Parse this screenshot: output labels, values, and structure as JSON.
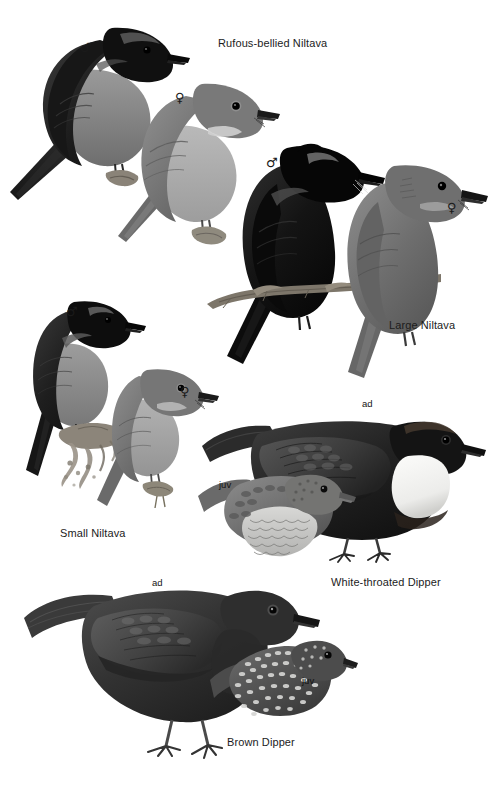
{
  "page": {
    "width": 499,
    "height": 788,
    "background": "#ffffff",
    "type": "field-guide-illustration-plate"
  },
  "palette": {
    "ink": "#1c1c1c",
    "dark_plumage": "#242424",
    "black_plumage": "#0d0d0d",
    "mid_grey": "#6f6f6f",
    "light_grey": "#a9a9a9",
    "pale_belly": "#c8c8c8",
    "white_patch": "#f2f2ef",
    "perch_brown": "#7a7369"
  },
  "plates": [
    {
      "id": "rufous-bellied-niltava",
      "label": "Rufous-bellied Niltava",
      "label_pos": {
        "x": 218,
        "y": 38
      },
      "birds": [
        {
          "id": "rbn-male",
          "sex": "♂",
          "sex_pos": {
            "x": 80,
            "y": 41
          }
        },
        {
          "id": "rbn-female",
          "sex": "♀",
          "sex_pos": {
            "x": 175,
            "y": 91
          }
        }
      ]
    },
    {
      "id": "large-niltava",
      "label": "Large Niltava",
      "label_pos": {
        "x": 389,
        "y": 320
      },
      "birds": [
        {
          "id": "ln-male",
          "sex": "♂",
          "sex_pos": {
            "x": 266,
            "y": 156
          }
        },
        {
          "id": "ln-female",
          "sex": "♀",
          "sex_pos": {
            "x": 447,
            "y": 201
          }
        }
      ]
    },
    {
      "id": "small-niltava",
      "label": "Small Niltava",
      "label_pos": {
        "x": 60,
        "y": 528
      },
      "birds": [
        {
          "id": "sn-male",
          "sex": "♂",
          "sex_pos": {
            "x": 66,
            "y": 305
          }
        },
        {
          "id": "sn-female",
          "sex": "♀",
          "sex_pos": {
            "x": 180,
            "y": 385
          }
        }
      ]
    },
    {
      "id": "white-throated-dipper",
      "label": "White-throated Dipper",
      "label_pos": {
        "x": 331,
        "y": 577
      },
      "birds": [
        {
          "id": "wtd-adult",
          "age": "ad",
          "age_pos": {
            "x": 362,
            "y": 399
          }
        },
        {
          "id": "wtd-juvenile",
          "age": "juv",
          "age_pos": {
            "x": 219,
            "y": 480
          }
        }
      ]
    },
    {
      "id": "brown-dipper",
      "label": "Brown Dipper",
      "label_pos": {
        "x": 227,
        "y": 737
      },
      "birds": [
        {
          "id": "bd-adult",
          "age": "ad",
          "age_pos": {
            "x": 152,
            "y": 578
          }
        },
        {
          "id": "bd-juvenile",
          "age": "juv",
          "age_pos": {
            "x": 302,
            "y": 676
          }
        }
      ]
    }
  ]
}
